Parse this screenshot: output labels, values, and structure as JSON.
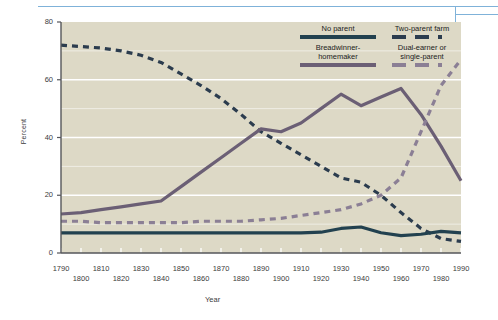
{
  "chart_data": {
    "type": "line",
    "title": "",
    "xlabel": "Year",
    "ylabel": "Percent",
    "xlim": [
      1790,
      1990
    ],
    "ylim": [
      0,
      80
    ],
    "grid": true,
    "legend_position": "top-right",
    "x_tick_labels_row1": [
      "1790",
      "1810",
      "1830",
      "1850",
      "1870",
      "1890",
      "1910",
      "1930",
      "1950",
      "1970",
      "1990"
    ],
    "x_tick_labels_row2": [
      "1800",
      "1820",
      "1840",
      "1860",
      "1880",
      "1900",
      "1920",
      "1940",
      "1960",
      "1980"
    ],
    "y_tick_labels": [
      "0",
      "20",
      "40",
      "60",
      "80"
    ],
    "x": [
      1790,
      1800,
      1810,
      1820,
      1830,
      1840,
      1850,
      1860,
      1870,
      1880,
      1890,
      1900,
      1910,
      1920,
      1930,
      1940,
      1950,
      1960,
      1970,
      1980,
      1990
    ],
    "series": [
      {
        "name": "Two-parent farm",
        "style": "dashed",
        "color": "#2b3c4e",
        "values": [
          72,
          71.5,
          71,
          70,
          68.5,
          66,
          62,
          58,
          53.5,
          48,
          42,
          38,
          34,
          30,
          26,
          24.5,
          20,
          14,
          8.5,
          5,
          4
        ]
      },
      {
        "name": "Breadwinner-homemaker",
        "style": "solid",
        "color": "#6b5f75",
        "values": [
          13.5,
          14,
          15,
          16,
          17,
          18,
          23,
          28,
          33,
          38,
          43,
          42,
          45,
          50,
          55,
          51,
          54,
          57,
          48,
          37,
          25
        ]
      },
      {
        "name": "Dual-earner or single-parent",
        "style": "dashed",
        "color": "#8b7f95",
        "values": [
          11,
          11,
          10.5,
          10.5,
          10.5,
          10.5,
          10.5,
          11,
          11,
          11,
          11.5,
          12,
          13,
          14,
          15,
          17,
          20,
          26,
          42,
          58,
          67
        ]
      },
      {
        "name": "No parent",
        "style": "solid",
        "color": "#22414f",
        "values": [
          7,
          7,
          7,
          7,
          7,
          7,
          7,
          7,
          7,
          7,
          7,
          7,
          7,
          7.2,
          8.5,
          9,
          7,
          6,
          6.5,
          7.5,
          7
        ]
      }
    ]
  },
  "legend": {
    "entries": [
      {
        "label_line1": "No parent",
        "label_line2": "",
        "style": "solid",
        "color": "#22414f"
      },
      {
        "label_line1": "Two-parent farm",
        "label_line2": "",
        "style": "dashed",
        "color": "#2b3c4e"
      },
      {
        "label_line1": "Breadwinner-",
        "label_line2": "homemaker",
        "style": "solid",
        "color": "#6b5f75"
      },
      {
        "label_line1": "Dual-earner or",
        "label_line2": "single-parent",
        "style": "dashed",
        "color": "#8b7f95"
      }
    ]
  },
  "axes": {
    "y_title": "Percent",
    "x_title": "Year",
    "y_ticks": [
      "80",
      "60",
      "40",
      "20",
      "0"
    ],
    "x_ticks_upper": [
      "1790",
      "1810",
      "1830",
      "1850",
      "1870",
      "1890",
      "1910",
      "1930",
      "1950",
      "1970",
      "1990"
    ],
    "x_ticks_lower": [
      "1800",
      "1820",
      "1840",
      "1860",
      "1880",
      "1900",
      "1920",
      "1940",
      "1960",
      "1980"
    ]
  },
  "colors": {
    "plot_background": "#ddd9c6",
    "gridline": "#ffffff",
    "axis": "#55565a",
    "rule": "#7fb2d9",
    "no_parent": "#22414f",
    "two_parent_farm": "#2b3c4e",
    "breadwinner": "#6b5f75",
    "dual_earner": "#8b7f95"
  }
}
